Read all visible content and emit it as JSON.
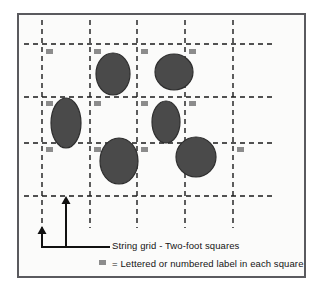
{
  "figure": {
    "background_color": "#fbfbfa",
    "border_color": "#5a5a5e"
  },
  "grid": {
    "line_color": "#1a1a1a",
    "line_style": "dashed",
    "vertical_lines_x": [
      42,
      90,
      137,
      185,
      233
    ],
    "horizontal_lines_y": [
      44,
      97,
      143,
      196
    ],
    "vertical_extent": [
      20,
      228
    ],
    "horizontal_extent": [
      24,
      273
    ]
  },
  "labels": {
    "marker_color": "#8c8c8c",
    "marker_width": 7,
    "marker_height": 5,
    "positions": [
      {
        "x": 46,
        "y": 49
      },
      {
        "x": 94,
        "y": 49
      },
      {
        "x": 141,
        "y": 49
      },
      {
        "x": 189,
        "y": 49
      },
      {
        "x": 46,
        "y": 101
      },
      {
        "x": 94,
        "y": 101
      },
      {
        "x": 141,
        "y": 101
      },
      {
        "x": 189,
        "y": 101
      },
      {
        "x": 46,
        "y": 147
      },
      {
        "x": 94,
        "y": 147
      },
      {
        "x": 141,
        "y": 147
      },
      {
        "x": 237,
        "y": 147
      }
    ]
  },
  "features": {
    "fill_color": "#4a4a4a",
    "stroke_color": "#2e2e2e",
    "ellipses": [
      {
        "cx": 113,
        "cy": 74,
        "rx": 17,
        "ry": 21,
        "rotation": 0
      },
      {
        "cx": 174,
        "cy": 72,
        "rx": 19,
        "ry": 18,
        "rotation": 0
      },
      {
        "cx": 66,
        "cy": 123,
        "rx": 15,
        "ry": 25,
        "rotation": 0
      },
      {
        "cx": 166,
        "cy": 122,
        "rx": 14,
        "ry": 21,
        "rotation": 0
      },
      {
        "cx": 119,
        "cy": 161,
        "rx": 19,
        "ry": 23,
        "rotation": 0
      },
      {
        "cx": 196,
        "cy": 157,
        "rx": 20,
        "ry": 20,
        "rotation": 0
      }
    ]
  },
  "callout": {
    "line_color": "#111111",
    "leader_y": 247,
    "leader_x_start": 41,
    "leader_x_end": 108,
    "arrows": [
      {
        "x": 42,
        "y_tip": 226,
        "y_base": 247,
        "name": "short-arrow"
      },
      {
        "x": 66,
        "y_tip": 196,
        "y_base": 247,
        "name": "tall-arrow"
      }
    ]
  },
  "legend": {
    "grid_line_label": "String grid - Two-foot squares",
    "label_marker_label": "= Lettered or numbered label in each square",
    "grid_swatch": {
      "x": 96,
      "y": 247,
      "width": 14,
      "color": "#111111"
    },
    "label_swatch": {
      "x": 99,
      "y": 260,
      "width": 7,
      "height": 5,
      "color": "#8c8c8c"
    }
  }
}
